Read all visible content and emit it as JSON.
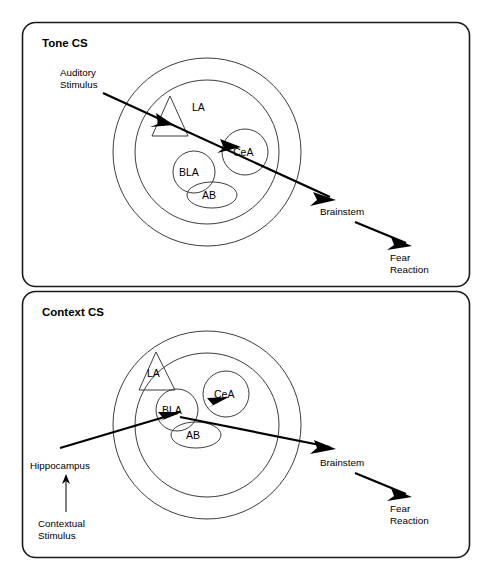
{
  "figure": {
    "width": 489,
    "height": 577,
    "background_color": "#ffffff",
    "line_color": "#000000",
    "outline_color": "#3d3d3d"
  },
  "panels": [
    {
      "id": "tone",
      "title": "Tone CS",
      "input_label_line1": "Auditory",
      "input_label_line2": "Stimulus",
      "structures": [
        {
          "name": "LA",
          "shape": "triangle"
        },
        {
          "name": "CeA",
          "shape": "circle"
        },
        {
          "name": "BLA",
          "shape": "circle"
        },
        {
          "name": "AB",
          "shape": "ellipse"
        }
      ],
      "output_label_1": "Brainstem",
      "output_label_2_line1": "Fear",
      "output_label_2_line2": "Reaction",
      "pathway": "Auditory Stimulus → LA → CeA → Brainstem → Fear Reaction"
    },
    {
      "id": "context",
      "title": "Context CS",
      "input_label": "Hippocampus",
      "source_label_line1": "Contextual",
      "source_label_line2": "Stimulus",
      "structures": [
        {
          "name": "LA",
          "shape": "triangle"
        },
        {
          "name": "CeA",
          "shape": "circle"
        },
        {
          "name": "BLA",
          "shape": "circle"
        },
        {
          "name": "AB",
          "shape": "ellipse"
        }
      ],
      "output_label_1": "Brainstem",
      "output_label_2_line1": "Fear",
      "output_label_2_line2": "Reaction",
      "pathway": "Contextual Stimulus → Hippocampus → BLA → CeA → Brainstem → Fear Reaction"
    }
  ]
}
